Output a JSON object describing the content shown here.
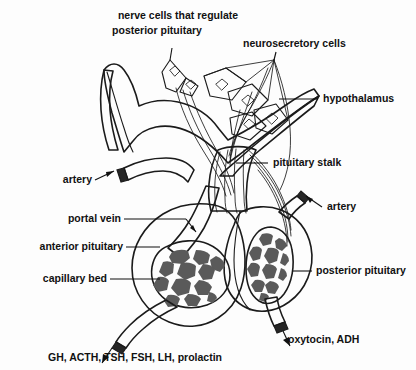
{
  "figure": {
    "background_color": "#fdfdfd",
    "ink_color": "#1b1b1b",
    "tissue_fill": "#b9b9b9",
    "tissue_fill_light": "#c9c9c9",
    "capillary_cell_color": "#5a5a5a",
    "label_color": "#111111"
  },
  "labels": {
    "nerve_cells": "nerve cells that regulate",
    "nerve_cells_line2": "posterior pituitary",
    "neurosecretory_cells": "neurosecretory cells",
    "hypothalamus": "hypothalamus",
    "pituitary_stalk": "pituitary stalk",
    "artery_left": "artery",
    "artery_right": "artery",
    "portal_vein": "portal vein",
    "anterior_pituitary": "anterior pituitary",
    "capillary_bed": "capillary bed",
    "posterior_pituitary": "posterior pituitary",
    "anterior_hormones": "GH, ACTH, TSH, FSH, LH, prolactin",
    "posterior_hormones": "oxytocin, ADH"
  },
  "structures": [
    {
      "name": "hypothalamus",
      "kind": "brain-tissue"
    },
    {
      "name": "pituitary-stalk",
      "kind": "infundibulum"
    },
    {
      "name": "anterior-pituitary",
      "kind": "lobe"
    },
    {
      "name": "posterior-pituitary",
      "kind": "lobe"
    },
    {
      "name": "anterior-capillary-bed",
      "kind": "capillary-plexus"
    },
    {
      "name": "posterior-capillary-bed",
      "kind": "capillary-plexus"
    },
    {
      "name": "portal-vein",
      "kind": "vessel"
    },
    {
      "name": "superior-artery",
      "kind": "vessel"
    },
    {
      "name": "inferior-artery",
      "kind": "vessel"
    },
    {
      "name": "anterior-outflow-vein",
      "kind": "vessel"
    },
    {
      "name": "posterior-outflow-vein",
      "kind": "vessel"
    },
    {
      "name": "neurosecretory-cells",
      "kind": "neuron-cluster"
    },
    {
      "name": "posterior-regulating-neurons",
      "kind": "neuron-cluster"
    }
  ]
}
